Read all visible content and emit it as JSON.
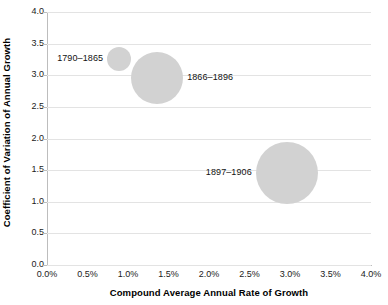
{
  "chart_data": {
    "type": "scatter",
    "title": "",
    "xlabel": "Compound Average Annual Rate of Growth",
    "ylabel": "Coefficient of Variation of Annual Growth",
    "xlim": [
      0.0,
      4.0
    ],
    "ylim": [
      0.0,
      4.0
    ],
    "grid": "horizontal",
    "legend": "none",
    "x_tick_labels": [
      "0.0%",
      "0.5%",
      "1.0%",
      "1.5%",
      "2.0%",
      "2.5%",
      "3.0%",
      "3.5%",
      "4.0%"
    ],
    "x_tick_values": [
      0.0,
      0.5,
      1.0,
      1.5,
      2.0,
      2.5,
      3.0,
      3.5,
      4.0
    ],
    "y_tick_labels": [
      "0.0",
      "0.5",
      "1.0",
      "1.5",
      "2.0",
      "2.5",
      "3.0",
      "3.5",
      "4.0"
    ],
    "y_tick_values": [
      0.0,
      0.5,
      1.0,
      1.5,
      2.0,
      2.5,
      3.0,
      3.5,
      4.0
    ],
    "bubble_color": "#d2d2d2",
    "points": [
      {
        "label": "1790–1865",
        "x": 0.89,
        "y": 3.25,
        "radius_px": 12,
        "label_side": "left"
      },
      {
        "label": "1866–1896",
        "x": 1.36,
        "y": 2.95,
        "radius_px": 26,
        "label_side": "right"
      },
      {
        "label": "1897–1906",
        "x": 2.96,
        "y": 1.45,
        "radius_px": 31,
        "label_side": "left"
      }
    ]
  },
  "axes": {
    "x_title": "Compound Average Annual Rate of Growth",
    "y_title": "Coefficient of Variation of Annual Growth"
  }
}
